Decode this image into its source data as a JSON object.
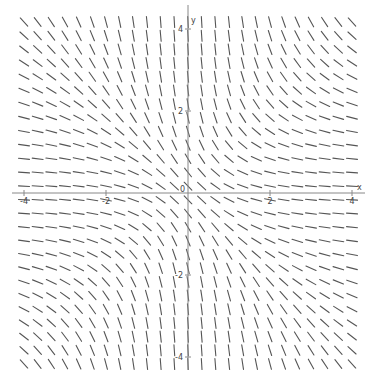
{
  "diagram": {
    "type": "slope_field",
    "equation": "dy/dx = -(1+y^2)/(1+x^2)",
    "axes": {
      "x_label": "x",
      "y_label": "y",
      "origin_label": "0",
      "x_ticks": [
        {
          "value": -4,
          "label": "-4"
        },
        {
          "value": -2,
          "label": "-2"
        },
        {
          "value": 2,
          "label": "2"
        },
        {
          "value": 4,
          "label": "4"
        }
      ],
      "y_ticks": [
        {
          "value": 4,
          "label": "4"
        },
        {
          "value": 2,
          "label": "2"
        },
        {
          "value": -2,
          "label": "-2"
        },
        {
          "value": -4,
          "label": "-4"
        }
      ]
    },
    "grid": {
      "x_min": -4,
      "x_max": 4,
      "x_count": 25,
      "y_min": -4.17,
      "y_max": 4.17,
      "y_count": 26,
      "segment_length_px": 11
    },
    "view": {
      "origin_px": [
        188,
        193
      ],
      "unit_px": 41,
      "x_axis_px": [
        12,
        365
      ],
      "y_axis_px": [
        5,
        370
      ]
    },
    "colors": {
      "segment": "#555555",
      "axis": "#888888",
      "label": "#444444",
      "background": "#ffffff"
    }
  }
}
